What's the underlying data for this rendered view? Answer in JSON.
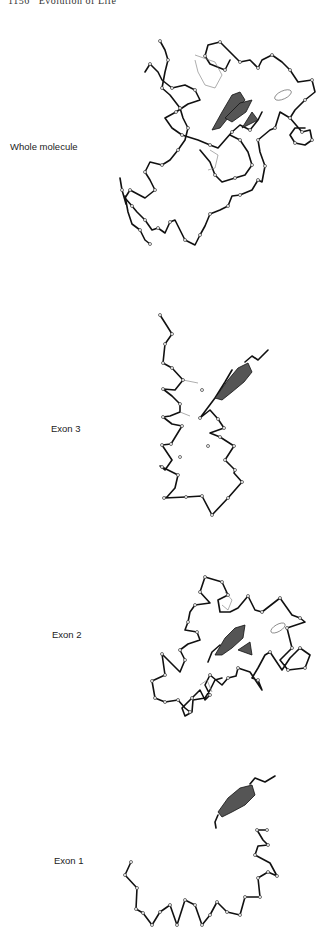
{
  "header": {
    "running_head": "1156   Evolution of Life"
  },
  "figure": {
    "panels": [
      {
        "id": "whole",
        "label": "Whole molecule"
      },
      {
        "id": "exon3",
        "label": "Exon 3"
      },
      {
        "id": "exon2",
        "label": "Exon 2"
      },
      {
        "id": "exon1",
        "label": "Exon 1"
      }
    ],
    "colors": {
      "backbone": "#111111",
      "heme": "#555555",
      "background": "#ffffff"
    }
  }
}
